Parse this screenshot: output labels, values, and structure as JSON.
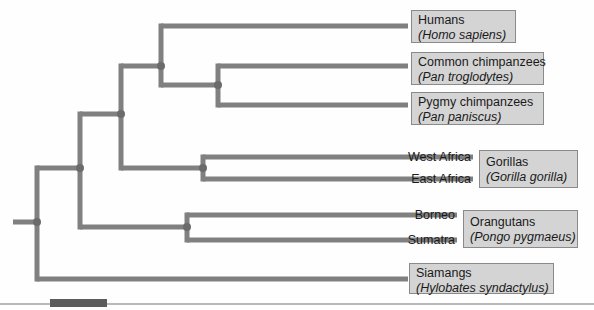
{
  "figure": {
    "kind": "phylogenetic-tree",
    "orientation": "left-to-right",
    "line_color": "#808080",
    "node_color": "#6b6b6b",
    "box_fill": "#d4d4d4",
    "box_border": "#8a8a8a",
    "text_color": "#1a1a1a",
    "canvas": {
      "width": 594,
      "height": 310
    }
  },
  "taxa": {
    "humans": {
      "common": "Humans",
      "latin": "(Homo sapiens)",
      "box": {
        "x": 411,
        "y": 10,
        "w": 105,
        "h": 33
      },
      "tip_y": 26
    },
    "common_chimp": {
      "common": "Common chimpanzees",
      "latin": "(Pan troglodytes)",
      "box": {
        "x": 411,
        "y": 52,
        "w": 133,
        "h": 33
      },
      "tip_y": 66
    },
    "pygmy_chimp": {
      "common": "Pygmy chimpanzees",
      "latin": "(Pan paniscus)",
      "box": {
        "x": 411,
        "y": 92,
        "w": 133,
        "h": 33
      },
      "tip_y": 105
    },
    "gorillas": {
      "common": "Gorillas",
      "latin": "(Gorilla gorilla)",
      "box": {
        "x": 479,
        "y": 150,
        "w": 99,
        "h": 38
      },
      "tips": [
        {
          "label": "West Africa",
          "tip_y": 157
        },
        {
          "label": "East Africa",
          "tip_y": 179
        }
      ]
    },
    "orangutans": {
      "common": "Orangutans",
      "latin": "(Pongo pygmaeus)",
      "box": {
        "x": 463,
        "y": 210,
        "w": 115,
        "h": 38
      },
      "tips": [
        {
          "label": "Borneo",
          "tip_y": 215
        },
        {
          "label": "Sumatra",
          "tip_y": 240
        }
      ]
    },
    "siamangs": {
      "common": "Siamangs",
      "latin": "(Hylobates syndactylus)",
      "box": {
        "x": 409,
        "y": 263,
        "w": 145,
        "h": 30
      },
      "tip_y": 279
    }
  },
  "tree_geometry": {
    "root_stub": {
      "x1": 13,
      "x2": 37,
      "y": 222
    },
    "nodes": [
      {
        "id": "root",
        "x": 37,
        "y": 222
      },
      {
        "id": "great-apes",
        "x": 80,
        "y": 168
      },
      {
        "id": "african-apes",
        "x": 121,
        "y": 114
      },
      {
        "id": "homininae",
        "x": 161,
        "y": 66
      },
      {
        "id": "pan",
        "x": 218,
        "y": 85
      },
      {
        "id": "gorilla-split",
        "x": 203,
        "y": 168
      },
      {
        "id": "pongo-split",
        "x": 187,
        "y": 227
      }
    ],
    "branches": [
      {
        "from": "root",
        "to": "great-apes",
        "child_y": 168
      },
      {
        "from": "root",
        "to": "siamangs",
        "child_y": 279
      },
      {
        "from": "great-apes",
        "to": "african-apes",
        "child_y": 114
      },
      {
        "from": "great-apes",
        "to": "pongo-split",
        "child_y": 227
      },
      {
        "from": "african-apes",
        "to": "homininae",
        "child_y": 66
      },
      {
        "from": "african-apes",
        "to": "gorilla-split",
        "child_y": 168
      },
      {
        "from": "homininae",
        "to": "humans",
        "child_y": 26
      },
      {
        "from": "homininae",
        "to": "pan",
        "child_y": 85
      },
      {
        "from": "pan",
        "to": "common-chimp",
        "child_y": 66
      },
      {
        "from": "pan",
        "to": "pygmy-chimp",
        "child_y": 105
      },
      {
        "from": "gorilla-split",
        "to": "west-africa",
        "child_y": 157
      },
      {
        "from": "gorilla-split",
        "to": "east-africa",
        "child_y": 179
      },
      {
        "from": "pongo-split",
        "to": "borneo",
        "child_y": 215
      },
      {
        "from": "pongo-split",
        "to": "sumatra",
        "child_y": 240
      }
    ],
    "tip_x_boxed": 408,
    "tip_x_gorilla": 473,
    "tip_x_orangutan": 457
  },
  "footer": {
    "rule_color": "#b9b9b9",
    "swatch_color": "#5c5c5c"
  }
}
